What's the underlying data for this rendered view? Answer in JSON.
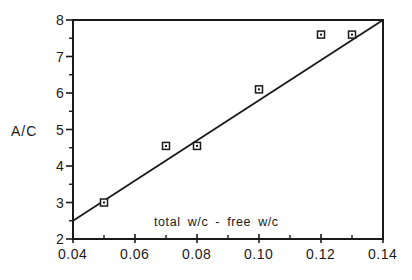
{
  "chart_data": {
    "type": "scatter",
    "title": "",
    "xlabel": "",
    "ylabel": "A/C",
    "annotation": "total w/c - free w/c",
    "xlim": [
      0.04,
      0.14
    ],
    "ylim": [
      2,
      8
    ],
    "x_ticks": [
      "0.04",
      "0.06",
      "0.08",
      "0.10",
      "0.12",
      "0.14"
    ],
    "x_tick_values": [
      0.04,
      0.06,
      0.08,
      0.1,
      0.12,
      0.14
    ],
    "x_minor_ticks": [
      0.05,
      0.07,
      0.09,
      0.11,
      0.13
    ],
    "y_ticks": [
      "2",
      "3",
      "4",
      "5",
      "6",
      "7",
      "8"
    ],
    "y_tick_values": [
      2,
      3,
      4,
      5,
      6,
      7,
      8
    ],
    "y_minor_ticks": [
      2.5,
      3.5,
      4.5,
      5.5,
      6.5,
      7.5
    ],
    "grid": false,
    "legend": null,
    "series": [
      {
        "name": "measured",
        "marker": "square",
        "x": [
          0.05,
          0.07,
          0.08,
          0.1,
          0.12,
          0.13
        ],
        "y": [
          3.0,
          4.55,
          4.55,
          6.1,
          7.6,
          7.6
        ]
      },
      {
        "name": "fit line",
        "type": "line",
        "x": [
          0.04,
          0.14
        ],
        "y": [
          2.5,
          8.0
        ]
      }
    ]
  }
}
